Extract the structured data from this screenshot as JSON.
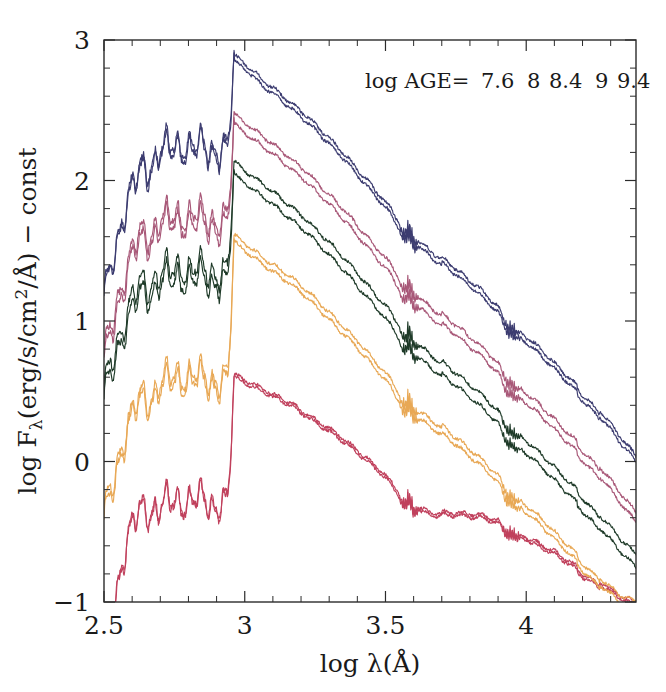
{
  "figure": {
    "title": "",
    "background_color": "#ffffff",
    "frame_color": "#2b2b2b"
  },
  "legend": {
    "prefix_label": "log AGE=",
    "position": "top-right",
    "entries": [
      {
        "label": "7.6",
        "color": "#3c3c70"
      },
      {
        "label": "8",
        "color": "#a85878"
      },
      {
        "label": "8.4",
        "color": "#1e3a28"
      },
      {
        "label": "9",
        "color": "#e8a855"
      },
      {
        "label": "9.4",
        "color": "#c0405c"
      }
    ]
  },
  "axes": {
    "x": {
      "label": "log λ(Å)",
      "min": 2.5,
      "max": 4.39,
      "major_ticks": [
        2.5,
        3,
        3.5,
        4
      ],
      "major_tick_labels": [
        "2.5",
        "3",
        "3.5",
        "4"
      ],
      "minor_tick_step": 0.1
    },
    "y": {
      "label": "log Fλ(erg/s/cm²/Å) − const",
      "label_parts": {
        "lead": "log F",
        "sub": "λ",
        "rest": "(erg/s/cm",
        "sup": "2",
        "tail": "/Å) − const"
      },
      "min": -1,
      "max": 3,
      "major_ticks": [
        -1,
        0,
        1,
        2,
        3
      ],
      "major_tick_labels": [
        "−1",
        "0",
        "1",
        "2",
        "3"
      ],
      "minor_tick_step": 0.2
    },
    "grid": false
  },
  "chart_data": {
    "type": "line",
    "title": "",
    "xlabel": "log λ(Å)",
    "ylabel": "log Fλ(erg/s/cm²/Å) − const",
    "xlim": [
      2.5,
      4.39
    ],
    "ylim": [
      -1,
      3
    ],
    "grid": false,
    "legend_position": "top-right",
    "legend_title": "log AGE=",
    "series": [
      {
        "name": "7.6",
        "label": "log AGE = 7.6",
        "color": "#3c3c70",
        "pair_offset": 0.04,
        "peak_level": 2.88,
        "break_x": 2.963,
        "uv_level": 2.15,
        "far_uv_level": 1.45,
        "x": [
          2.5,
          2.54,
          2.58,
          2.62,
          2.66,
          2.7,
          2.74,
          2.78,
          2.82,
          2.86,
          2.9,
          2.94,
          2.963,
          2.98,
          3.02,
          3.06,
          3.1,
          3.16,
          3.22,
          3.28,
          3.34,
          3.4,
          3.46,
          3.52,
          3.56,
          3.6,
          3.66,
          3.72,
          3.78,
          3.84,
          3.9,
          3.94,
          3.98,
          4.04,
          4.1,
          4.16,
          4.22,
          4.28,
          4.34,
          4.39
        ],
        "y": [
          1.46,
          1.62,
          1.95,
          2.04,
          2.08,
          2.26,
          2.22,
          2.28,
          2.24,
          2.26,
          2.22,
          2.2,
          2.9,
          2.86,
          2.8,
          2.72,
          2.66,
          2.56,
          2.46,
          2.34,
          2.22,
          2.08,
          1.94,
          1.8,
          1.66,
          1.62,
          1.52,
          1.42,
          1.32,
          1.22,
          1.1,
          0.96,
          0.92,
          0.82,
          0.7,
          0.58,
          0.46,
          0.32,
          0.16,
          0.04
        ]
      },
      {
        "name": "8",
        "label": "log AGE = 8",
        "color": "#a85878",
        "pair_offset": 0.07,
        "peak_level": 2.48,
        "break_x": 2.963,
        "uv_level": 1.72,
        "far_uv_level": 1.0,
        "x": [
          2.5,
          2.54,
          2.58,
          2.62,
          2.66,
          2.7,
          2.74,
          2.78,
          2.82,
          2.86,
          2.9,
          2.94,
          2.963,
          2.98,
          3.02,
          3.06,
          3.1,
          3.16,
          3.22,
          3.28,
          3.34,
          3.4,
          3.46,
          3.52,
          3.56,
          3.6,
          3.66,
          3.72,
          3.78,
          3.84,
          3.9,
          3.94,
          3.98,
          4.04,
          4.1,
          4.16,
          4.22,
          4.28,
          4.34,
          4.39
        ],
        "y": [
          1.04,
          1.18,
          1.48,
          1.58,
          1.6,
          1.76,
          1.72,
          1.78,
          1.74,
          1.76,
          1.72,
          1.7,
          2.48,
          2.44,
          2.38,
          2.32,
          2.26,
          2.16,
          2.06,
          1.94,
          1.82,
          1.68,
          1.54,
          1.4,
          1.26,
          1.22,
          1.12,
          1.02,
          0.92,
          0.82,
          0.7,
          0.56,
          0.52,
          0.42,
          0.3,
          0.18,
          0.06,
          -0.08,
          -0.24,
          -0.36
        ]
      },
      {
        "name": "8.4",
        "label": "log AGE = 8.4",
        "color": "#1e3a28",
        "pair_offset": 0.09,
        "peak_level": 2.14,
        "break_x": 2.963,
        "uv_level": 1.34,
        "far_uv_level": 0.78,
        "x": [
          2.5,
          2.54,
          2.58,
          2.62,
          2.66,
          2.7,
          2.74,
          2.78,
          2.82,
          2.86,
          2.9,
          2.94,
          2.963,
          2.98,
          3.02,
          3.06,
          3.1,
          3.16,
          3.22,
          3.28,
          3.34,
          3.4,
          3.46,
          3.52,
          3.56,
          3.6,
          3.66,
          3.72,
          3.78,
          3.84,
          3.9,
          3.94,
          3.98,
          4.04,
          4.1,
          4.16,
          4.22,
          4.28,
          4.34,
          4.39
        ],
        "y": [
          0.8,
          0.9,
          1.14,
          1.22,
          1.24,
          1.38,
          1.34,
          1.4,
          1.36,
          1.38,
          1.34,
          1.32,
          2.14,
          2.1,
          2.04,
          1.98,
          1.92,
          1.82,
          1.72,
          1.6,
          1.48,
          1.34,
          1.2,
          1.06,
          0.92,
          0.88,
          0.78,
          0.68,
          0.58,
          0.48,
          0.36,
          0.22,
          0.18,
          0.08,
          -0.04,
          -0.16,
          -0.28,
          -0.42,
          -0.56,
          -0.66
        ]
      },
      {
        "name": "9",
        "label": "log AGE = 9",
        "color": "#e8a855",
        "pair_offset": 0.05,
        "peak_level": 1.62,
        "break_x": 2.963,
        "uv_level": 0.66,
        "far_uv_level": 0.02,
        "x": [
          2.5,
          2.54,
          2.58,
          2.62,
          2.66,
          2.7,
          2.74,
          2.78,
          2.82,
          2.86,
          2.9,
          2.94,
          2.963,
          2.98,
          3.02,
          3.06,
          3.1,
          3.16,
          3.22,
          3.28,
          3.34,
          3.4,
          3.46,
          3.52,
          3.56,
          3.6,
          3.66,
          3.72,
          3.78,
          3.84,
          3.9,
          3.94,
          3.98,
          4.04,
          4.1,
          4.16,
          4.22,
          4.28,
          4.34,
          4.39
        ],
        "y": [
          -0.1,
          0.02,
          0.34,
          0.42,
          0.44,
          0.6,
          0.58,
          0.64,
          0.6,
          0.62,
          0.58,
          0.56,
          1.62,
          1.58,
          1.52,
          1.46,
          1.4,
          1.32,
          1.22,
          1.1,
          0.98,
          0.86,
          0.72,
          0.58,
          0.44,
          0.4,
          0.32,
          0.22,
          0.12,
          0.02,
          -0.1,
          -0.24,
          -0.28,
          -0.38,
          -0.5,
          -0.62,
          -0.74,
          -0.86,
          -0.96,
          -1.0
        ]
      },
      {
        "name": "9.4",
        "label": "log AGE = 9.4",
        "color": "#c0405c",
        "pair_offset": 0.02,
        "peak_level": 0.62,
        "break_x": 2.963,
        "uv_level": -0.3,
        "far_uv_level": -0.92,
        "x": [
          2.5,
          2.54,
          2.58,
          2.62,
          2.66,
          2.7,
          2.74,
          2.78,
          2.82,
          2.86,
          2.9,
          2.94,
          2.963,
          2.98,
          3.02,
          3.06,
          3.1,
          3.16,
          3.22,
          3.28,
          3.34,
          3.4,
          3.46,
          3.52,
          3.56,
          3.6,
          3.66,
          3.72,
          3.78,
          3.84,
          3.9,
          3.94,
          3.98,
          4.04,
          4.1,
          4.16,
          4.22,
          4.28,
          4.34,
          4.39
        ],
        "y": [
          -0.96,
          -0.88,
          -0.46,
          -0.38,
          -0.36,
          -0.28,
          -0.3,
          -0.26,
          -0.28,
          -0.26,
          -0.3,
          -0.32,
          0.62,
          0.6,
          0.56,
          0.52,
          0.48,
          0.42,
          0.34,
          0.26,
          0.18,
          0.08,
          -0.02,
          -0.14,
          -0.26,
          -0.3,
          -0.34,
          -0.36,
          -0.37,
          -0.38,
          -0.42,
          -0.5,
          -0.52,
          -0.58,
          -0.64,
          -0.72,
          -0.8,
          -0.88,
          -0.96,
          -1.0
        ]
      }
    ]
  }
}
